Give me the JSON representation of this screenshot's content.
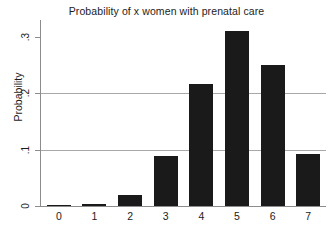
{
  "chart_data": {
    "type": "bar",
    "title": "Probability of x women with prenatal care",
    "xlabel": "",
    "ylabel": "Probability",
    "categories": [
      "0",
      "1",
      "2",
      "3",
      "4",
      "5",
      "6",
      "7"
    ],
    "values": [
      0.0003,
      0.004,
      0.019,
      0.088,
      0.216,
      0.311,
      0.25,
      0.092
    ],
    "ylim": [
      0,
      0.33
    ],
    "yticks": [
      0,
      0.1,
      0.2,
      0.3
    ],
    "ytick_labels": [
      "0",
      ".1",
      ".2",
      ".3"
    ],
    "xtick_labels": [
      "0",
      "1",
      "2",
      "3",
      "4",
      "5",
      "6",
      "7"
    ],
    "gridlines": [
      0.1,
      0.2
    ],
    "grid": true,
    "legend": false,
    "legend_position": "none",
    "bar_color": "#1a1a1a",
    "axis_color": "#8c8c8c",
    "grid_color": "#a8a8a8",
    "background": "#ffffff"
  }
}
